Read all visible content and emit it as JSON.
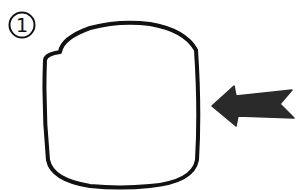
{
  "step": {
    "number": "1",
    "icon": "circled-number"
  },
  "shape": {
    "name": "rounded-square-outline",
    "stroke": "#111111",
    "fill": "#ffffff"
  },
  "arrow": {
    "name": "left-arrow-icon",
    "direction": "left",
    "fill": "#2a2a2a"
  },
  "colors": {
    "background": "#ffffff",
    "ink": "#111111"
  }
}
